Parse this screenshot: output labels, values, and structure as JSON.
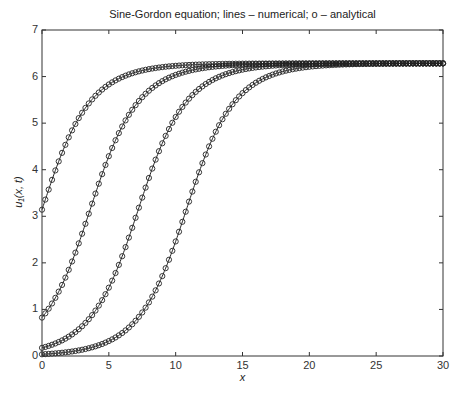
{
  "chart_data": {
    "type": "line",
    "title": "Sine-Gordon equation; lines – numerical; o – analytical",
    "xlabel": "x",
    "ylabel": "u₁(x, t)",
    "xlim": [
      0,
      30
    ],
    "ylim": [
      0,
      7
    ],
    "xticks": [
      0,
      5,
      10,
      15,
      20,
      25,
      30
    ],
    "yticks": [
      0,
      1,
      2,
      3,
      4,
      5,
      6,
      7
    ],
    "grid": false,
    "legend": "none (described in title: lines = numerical, o = analytical)",
    "model": "u = 4*atan(exp((x - x0)/w)), w ≈ 2.3",
    "series": [
      {
        "name": "t1",
        "x0": 0.0,
        "value_at_x0": 0.0,
        "sample_points": {
          "x": [
            0,
            2.5,
            5,
            10,
            15,
            30
          ],
          "y": [
            3.14,
            5.43,
            6.04,
            6.26,
            6.28,
            6.28
          ]
        }
      },
      {
        "name": "t2",
        "x0": 3.6,
        "sample_points": {
          "x": [
            0,
            2.5,
            5,
            10,
            15,
            30
          ],
          "y": [
            0.82,
            2.21,
            4.34,
            6.06,
            6.27,
            6.28
          ]
        }
      },
      {
        "name": "t3",
        "x0": 7.2,
        "sample_points": {
          "x": [
            0,
            2.5,
            5,
            10,
            15,
            30
          ],
          "y": [
            0.19,
            0.52,
            1.68,
            5.03,
            6.21,
            6.28
          ]
        }
      },
      {
        "name": "t4",
        "x0": 10.8,
        "sample_points": {
          "x": [
            0,
            2.5,
            5,
            10,
            15,
            30
          ],
          "y": [
            0.04,
            0.11,
            0.32,
            2.79,
            5.81,
            6.28
          ]
        }
      }
    ],
    "marker": "o",
    "marker_spacing": 0.25,
    "line_color": "#222222",
    "marker_color": "#222222"
  },
  "axes": {
    "title": "Sine-Gordon equation; lines – numerical; o – analytical",
    "xlabel": "x",
    "ylabel": "u₁(x, t)"
  }
}
